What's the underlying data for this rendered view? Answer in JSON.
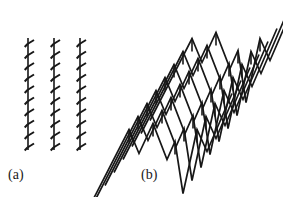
{
  "figure": {
    "background_color": "#ffffff",
    "stroke_color": "#171717",
    "width": 283,
    "height": 197,
    "panels": [
      {
        "id": "panel-a",
        "label": "(a)",
        "label_x": 8,
        "label_y": 168,
        "description": "three vertical straight lines with small barbs",
        "line_count": 3,
        "line_x_positions": [
          28,
          54,
          80
        ],
        "line_y_top": 38,
        "line_y_bottom": 150,
        "barb_count_per_line": 10,
        "barb_spacing": 11.5,
        "barb_dx": 6,
        "barb_dy": 4,
        "stroke_width_main": 1.6,
        "stroke_width_barb": 2.0
      },
      {
        "id": "panel-b",
        "label": "(b)",
        "label_x": 141,
        "label_y": 168,
        "description": "stack of parallel zigzag W-shaped curves sheared diagonally with vertical tick marks at vertices",
        "curve_count": 8,
        "curve_spacing_x": 9,
        "curve_spacing_y": 13,
        "origin_x": 150,
        "origin_y": 118,
        "vertices": [
          {
            "x": 0,
            "y": 48
          },
          {
            "x": 42,
            "y": -34
          },
          {
            "x": 52,
            "y": -10
          },
          {
            "x": 66,
            "y": -40
          },
          {
            "x": 80,
            "y": -4
          },
          {
            "x": 88,
            "y": -22
          },
          {
            "x": 96,
            "y": 30
          },
          {
            "x": 110,
            "y": -34
          },
          {
            "x": 120,
            "y": -12
          },
          {
            "x": 145,
            "y": -70
          }
        ],
        "tick_x_offsets": [
          42,
          66,
          88,
          110
        ],
        "tick_length": 13,
        "stroke_width_main": 1.7,
        "stroke_width_tick": 1.6
      }
    ]
  }
}
